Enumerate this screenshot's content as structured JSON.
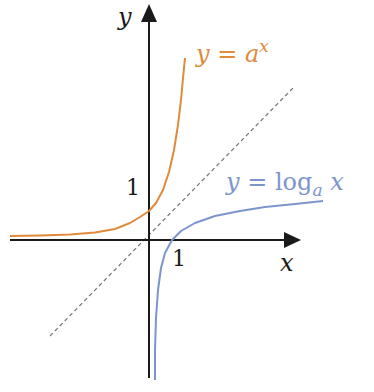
{
  "diagram": {
    "title": "",
    "axes": {
      "x_label": "x",
      "y_label": "y",
      "x_tick_label": "1",
      "y_tick_label": "1",
      "color": "#1a1a1a"
    },
    "curves": [
      {
        "id": "exponential",
        "label_prefix": "y = a",
        "label_sup": "x",
        "color": "#e08a3c"
      },
      {
        "id": "logarithm",
        "label_prefix": "y = log",
        "label_sub": "a",
        "label_suffix": " x",
        "color": "#7d95cf"
      }
    ],
    "reference_line": {
      "label": "y = x",
      "style": "dashed",
      "color": "#777777"
    }
  }
}
